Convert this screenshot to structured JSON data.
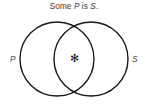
{
  "figure": {
    "width": 148,
    "height": 104,
    "background_color": "#ffffff",
    "caption": {
      "prefix": "Some ",
      "subject": "P",
      "copula": " is ",
      "predicate": "S",
      "period": ".",
      "full_text": "Some P is S.",
      "color": "#3a3a3a"
    },
    "diagram": {
      "type": "venn-two-set-overlapping",
      "stroke_color": "#1a1a1a",
      "fill_color": "none",
      "left_circle": {
        "label": "P",
        "cx": 57,
        "cy": 59,
        "r": 37
      },
      "right_circle": {
        "label": "S",
        "cx": 91,
        "cy": 59,
        "r": 37
      },
      "left_label": {
        "text": "P",
        "x": 10,
        "y": 62,
        "color": "#4a4a4a"
      },
      "right_label": {
        "text": "S",
        "x": 132,
        "y": 62,
        "color": "#4a4a4a"
      },
      "intersection_mark": {
        "text": "✻",
        "x": 74,
        "y": 62,
        "color": "#1a1a1a"
      }
    }
  }
}
